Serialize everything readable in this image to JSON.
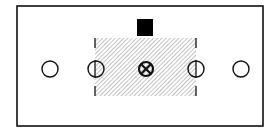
{
  "diagram": {
    "title": "",
    "colors": {
      "stroke": "#111111",
      "hatch": "#999999",
      "background": "#ffffff",
      "block": "#000000"
    },
    "frame": {
      "x": 17,
      "y": 6,
      "w": 246,
      "h": 120
    },
    "block": {
      "x": 137,
      "y": 19,
      "w": 16,
      "h": 17
    },
    "hatched_region": {
      "x": 95,
      "y": 38,
      "w": 101,
      "h": 58
    },
    "circles": [
      {
        "cx": 50,
        "cy": 69,
        "r": 8,
        "type": "open"
      },
      {
        "cx": 96,
        "cy": 69,
        "r": 8,
        "type": "split"
      },
      {
        "cx": 146,
        "cy": 69,
        "r": 7.5,
        "type": "crossed"
      },
      {
        "cx": 196,
        "cy": 69,
        "r": 8,
        "type": "split"
      },
      {
        "cx": 241,
        "cy": 69,
        "r": 8,
        "type": "open"
      }
    ]
  }
}
